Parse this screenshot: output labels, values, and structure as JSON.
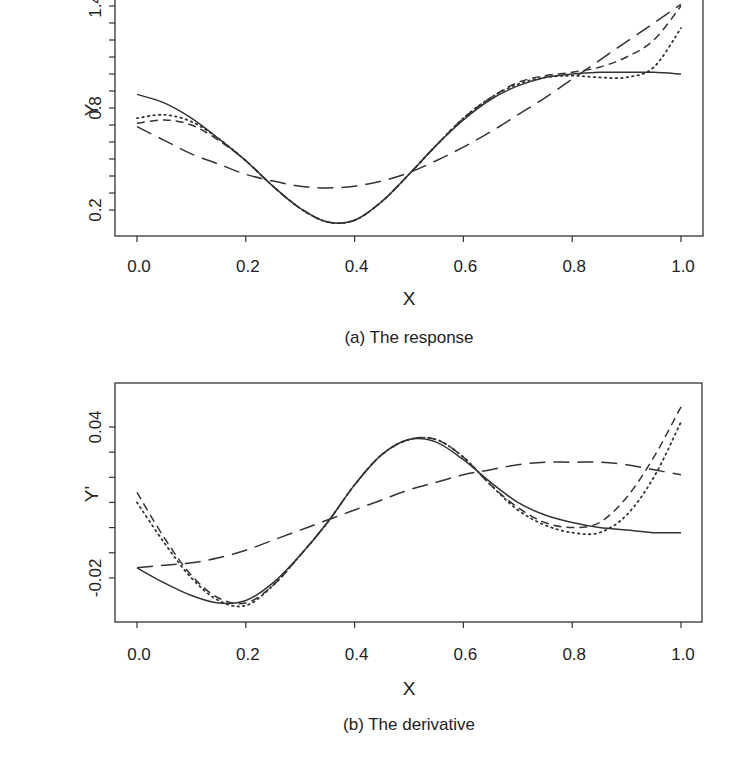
{
  "chart_data": [
    {
      "type": "line",
      "title": "",
      "caption": "(a) The response",
      "xlabel": "X",
      "ylabel": "Y",
      "xlim": [
        0.0,
        1.0
      ],
      "ylim": [
        0.05,
        1.45
      ],
      "xticks": [
        "0.0",
        "0.2",
        "0.4",
        "0.6",
        "0.8",
        "1.0"
      ],
      "yticks": [
        "0.2",
        "0.8",
        "1.4"
      ],
      "grid": false,
      "legend": "none",
      "x": [
        0.0,
        0.05,
        0.1,
        0.15,
        0.2,
        0.25,
        0.3,
        0.35,
        0.4,
        0.45,
        0.5,
        0.55,
        0.6,
        0.65,
        0.7,
        0.75,
        0.8,
        0.85,
        0.9,
        0.95,
        1.0
      ],
      "series": [
        {
          "name": "true function",
          "style": "solid",
          "values": [
            0.88,
            0.83,
            0.74,
            0.62,
            0.49,
            0.34,
            0.21,
            0.13,
            0.14,
            0.25,
            0.41,
            0.58,
            0.73,
            0.85,
            0.93,
            0.98,
            1.0,
            1.01,
            1.01,
            1.01,
            1.0
          ]
        },
        {
          "name": "estimate 1",
          "style": "dotted",
          "values": [
            0.74,
            0.76,
            0.72,
            0.62,
            0.49,
            0.34,
            0.21,
            0.13,
            0.14,
            0.25,
            0.41,
            0.58,
            0.74,
            0.86,
            0.94,
            0.98,
            0.99,
            0.98,
            0.98,
            1.04,
            1.27
          ]
        },
        {
          "name": "estimate 2",
          "style": "short-dash",
          "values": [
            0.71,
            0.73,
            0.7,
            0.61,
            0.49,
            0.34,
            0.21,
            0.13,
            0.14,
            0.25,
            0.41,
            0.58,
            0.74,
            0.86,
            0.95,
            0.99,
            1.01,
            1.04,
            1.1,
            1.2,
            1.4
          ]
        },
        {
          "name": "estimate 3",
          "style": "long-dash",
          "values": [
            0.69,
            0.61,
            0.53,
            0.47,
            0.41,
            0.37,
            0.34,
            0.33,
            0.34,
            0.37,
            0.42,
            0.49,
            0.57,
            0.66,
            0.76,
            0.86,
            0.97,
            1.08,
            1.19,
            1.3,
            1.41
          ]
        }
      ]
    },
    {
      "type": "line",
      "title": "",
      "caption": "(b) The derivative",
      "xlabel": "X",
      "ylabel": "Y'",
      "xlim": [
        0.0,
        1.0
      ],
      "ylim": [
        -0.035,
        0.055
      ],
      "xticks": [
        "0.0",
        "0.2",
        "0.4",
        "0.6",
        "0.8",
        "1.0"
      ],
      "yticks": [
        "-0.02",
        "0.04"
      ],
      "grid": false,
      "legend": "none",
      "x": [
        0.0,
        0.05,
        0.1,
        0.15,
        0.2,
        0.25,
        0.3,
        0.35,
        0.4,
        0.45,
        0.5,
        0.55,
        0.6,
        0.65,
        0.7,
        0.75,
        0.8,
        0.85,
        0.9,
        0.95,
        1.0
      ],
      "series": [
        {
          "name": "true derivative",
          "style": "solid",
          "values": [
            -0.016,
            -0.022,
            -0.027,
            -0.03,
            -0.029,
            -0.022,
            -0.011,
            0.002,
            0.017,
            0.029,
            0.035,
            0.034,
            0.027,
            0.018,
            0.01,
            0.005,
            0.002,
            0.0,
            -0.001,
            -0.002,
            -0.002
          ]
        },
        {
          "name": "estimate 1",
          "style": "dotted",
          "values": [
            0.01,
            -0.006,
            -0.02,
            -0.029,
            -0.031,
            -0.023,
            -0.011,
            0.002,
            0.017,
            0.029,
            0.035,
            0.035,
            0.028,
            0.017,
            0.007,
            0.001,
            -0.002,
            -0.002,
            0.005,
            0.02,
            0.042
          ]
        },
        {
          "name": "estimate 2",
          "style": "short-dash",
          "values": [
            0.014,
            -0.004,
            -0.019,
            -0.028,
            -0.03,
            -0.023,
            -0.011,
            0.002,
            0.017,
            0.029,
            0.035,
            0.035,
            0.028,
            0.017,
            0.008,
            0.002,
            0.0,
            0.002,
            0.012,
            0.028,
            0.048
          ]
        },
        {
          "name": "estimate 3",
          "style": "long-dash",
          "values": [
            -0.016,
            -0.015,
            -0.014,
            -0.012,
            -0.009,
            -0.005,
            -0.001,
            0.003,
            0.007,
            0.011,
            0.015,
            0.018,
            0.021,
            0.023,
            0.025,
            0.026,
            0.026,
            0.026,
            0.025,
            0.023,
            0.021
          ]
        }
      ]
    }
  ]
}
